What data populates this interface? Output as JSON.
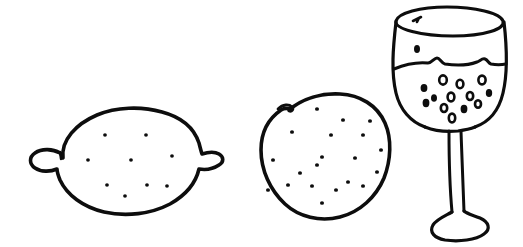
{
  "canvas": {
    "width": 523,
    "height": 247,
    "background_color": "#ffffff",
    "ink_color": "#0d0d0d",
    "style": "hand-drawn black ink line sketch, no shading",
    "title": "Hand-drawn sketch of a lemon, an orange and a glass of wine"
  },
  "objects": [
    {
      "id": "lemon",
      "label": "lemon",
      "description": "Hand-drawn lemon seen from the side, pointed nipple at left and right, speckled with small dots",
      "bbox": {
        "x": 28,
        "y": 107,
        "width": 196,
        "height": 110
      },
      "stroke_width": 3.4,
      "dot_count": 9,
      "dot_radius": 1.9
    },
    {
      "id": "orange",
      "label": "orange",
      "description": "Hand-drawn round orange with a small stem notch at the top left, speckled with many small dots",
      "bbox": {
        "x": 257,
        "y": 93,
        "width": 132,
        "height": 128
      },
      "stroke_width": 3.4,
      "dot_count": 20,
      "dot_radius": 2.0
    },
    {
      "id": "wine-glass",
      "label": "glass of wine",
      "description": "Hand-drawn stemmed wine glass, elliptical rim, wavy liquid line across the bowl, bubbles below the line, long stem and flared foot",
      "bbox": {
        "x": 385,
        "y": 6,
        "width": 122,
        "height": 235
      },
      "stroke_width": 3.2,
      "liquid_level_ratio": 0.47,
      "bubble_count": 14
    }
  ],
  "lemon_dots": [
    {
      "cx": 105,
      "cy": 135
    },
    {
      "cx": 146,
      "cy": 135
    },
    {
      "cx": 88,
      "cy": 160
    },
    {
      "cx": 131,
      "cy": 160
    },
    {
      "cx": 172,
      "cy": 156
    },
    {
      "cx": 107,
      "cy": 185
    },
    {
      "cx": 147,
      "cy": 185
    },
    {
      "cx": 167,
      "cy": 186
    },
    {
      "cx": 125,
      "cy": 196
    }
  ],
  "orange_dots": [
    {
      "cx": 317,
      "cy": 109
    },
    {
      "cx": 343,
      "cy": 120
    },
    {
      "cx": 292,
      "cy": 132
    },
    {
      "cx": 370,
      "cy": 121
    },
    {
      "cx": 331,
      "cy": 135
    },
    {
      "cx": 363,
      "cy": 135
    },
    {
      "cx": 273,
      "cy": 160
    },
    {
      "cx": 322,
      "cy": 157
    },
    {
      "cx": 355,
      "cy": 158
    },
    {
      "cx": 381,
      "cy": 150
    },
    {
      "cx": 317,
      "cy": 165
    },
    {
      "cx": 288,
      "cy": 185
    },
    {
      "cx": 312,
      "cy": 186
    },
    {
      "cx": 348,
      "cy": 182
    },
    {
      "cx": 363,
      "cy": 186
    },
    {
      "cx": 377,
      "cy": 172
    },
    {
      "cx": 268,
      "cy": 190
    },
    {
      "cx": 322,
      "cy": 203
    },
    {
      "cx": 336,
      "cy": 190
    },
    {
      "cx": 300,
      "cy": 173
    }
  ],
  "wine_bubbles": [
    {
      "cx": 417,
      "cy": 49,
      "rx": 3.0,
      "ry": 4.0,
      "filled": true
    },
    {
      "cx": 424,
      "cy": 88,
      "rx": 3.4,
      "ry": 4.0,
      "filled": true
    },
    {
      "cx": 443,
      "cy": 80,
      "rx": 3.8,
      "ry": 4.6,
      "filled": false
    },
    {
      "cx": 460,
      "cy": 84,
      "rx": 3.4,
      "ry": 4.2,
      "filled": false
    },
    {
      "cx": 482,
      "cy": 80,
      "rx": 3.6,
      "ry": 4.4,
      "filled": false
    },
    {
      "cx": 434,
      "cy": 98,
      "rx": 3.0,
      "ry": 3.8,
      "filled": true
    },
    {
      "cx": 451,
      "cy": 97,
      "rx": 3.4,
      "ry": 4.4,
      "filled": false
    },
    {
      "cx": 470,
      "cy": 96,
      "rx": 3.2,
      "ry": 4.0,
      "filled": false
    },
    {
      "cx": 489,
      "cy": 93,
      "rx": 3.2,
      "ry": 4.0,
      "filled": true
    },
    {
      "cx": 426,
      "cy": 103,
      "rx": 3.4,
      "ry": 4.2,
      "filled": true
    },
    {
      "cx": 444,
      "cy": 108,
      "rx": 3.2,
      "ry": 4.0,
      "filled": false
    },
    {
      "cx": 464,
      "cy": 109,
      "rx": 3.4,
      "ry": 4.2,
      "filled": true
    },
    {
      "cx": 478,
      "cy": 104,
      "rx": 3.0,
      "ry": 3.8,
      "filled": false
    },
    {
      "cx": 452,
      "cy": 118,
      "rx": 3.2,
      "ry": 4.4,
      "filled": false
    }
  ],
  "wine_glass_marks": {
    "rim_tick": "small ink tick inside the rim ellipse at upper left"
  }
}
